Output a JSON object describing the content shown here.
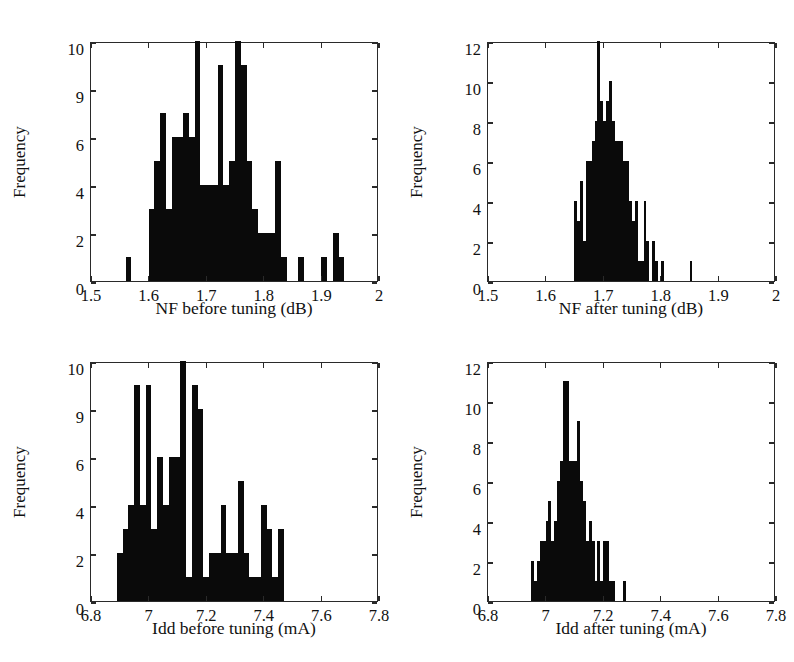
{
  "figure": {
    "kind": "four-panel-histogram-figure",
    "background": "#ffffff",
    "bar_color": "#0a0a0a",
    "axis_color": "#2a2a2a"
  },
  "chart_data": [
    {
      "id": "nf-before-tuning",
      "type": "bar",
      "title": "",
      "xlabel": "NF before tuning (dB)",
      "ylabel": "Frequency",
      "xlim": [
        1.5,
        2.0
      ],
      "ylim": [
        0,
        10
      ],
      "grid": false,
      "legend": "none",
      "xticks": [
        1.5,
        1.6,
        1.7,
        1.8,
        1.9,
        2.0
      ],
      "xticklabels": [
        "1.5",
        "1.6",
        "1.7",
        "1.8",
        "1.9",
        "2"
      ],
      "yticks": [
        0,
        2,
        4,
        6,
        8,
        10
      ],
      "yticklabels": [
        "0",
        "2",
        "4",
        "6",
        "9",
        "10"
      ],
      "bin_width": 0.01,
      "bins": [
        1.56,
        1.57,
        1.58,
        1.59,
        1.6,
        1.61,
        1.62,
        1.63,
        1.64,
        1.65,
        1.66,
        1.67,
        1.68,
        1.69,
        1.7,
        1.71,
        1.72,
        1.73,
        1.74,
        1.75,
        1.76,
        1.77,
        1.78,
        1.79,
        1.8,
        1.81,
        1.82,
        1.83,
        1.84,
        1.86,
        1.87,
        1.9,
        1.92,
        1.93
      ],
      "values": [
        1,
        0,
        0,
        0,
        3,
        5,
        7,
        3,
        6,
        6,
        7,
        6,
        10,
        4,
        4,
        4,
        9,
        4,
        5,
        10,
        9,
        5,
        3,
        2,
        2,
        2,
        5,
        1,
        0,
        1,
        0,
        1,
        2,
        1
      ]
    },
    {
      "id": "nf-after-tuning",
      "type": "bar",
      "title": "",
      "xlabel": "NF after tuning (dB)",
      "ylabel": "Frequency",
      "xlim": [
        1.5,
        2.0
      ],
      "ylim": [
        0,
        12
      ],
      "grid": false,
      "legend": "none",
      "xticks": [
        1.5,
        1.6,
        1.7,
        1.8,
        1.9,
        2.0
      ],
      "xticklabels": [
        "1.5",
        "1.6",
        "1.7",
        "1.8",
        "1.9",
        "2"
      ],
      "yticks": [
        0,
        2,
        4,
        6,
        8,
        10,
        12
      ],
      "yticklabels": [
        "0",
        "2",
        "4",
        "6",
        "8",
        "10",
        "12"
      ],
      "bin_width": 0.005,
      "bins": [
        1.65,
        1.655,
        1.66,
        1.665,
        1.67,
        1.675,
        1.68,
        1.685,
        1.69,
        1.695,
        1.7,
        1.705,
        1.71,
        1.715,
        1.72,
        1.725,
        1.73,
        1.735,
        1.74,
        1.745,
        1.75,
        1.755,
        1.76,
        1.765,
        1.77,
        1.775,
        1.785,
        1.79,
        1.8,
        1.85
      ],
      "values": [
        4,
        3,
        5,
        2,
        6,
        6,
        7,
        8,
        12,
        9,
        8,
        9,
        10,
        8,
        7,
        7,
        7,
        6,
        6,
        4,
        3,
        4,
        1,
        1,
        4,
        2,
        2,
        1,
        1,
        1
      ]
    },
    {
      "id": "idd-before-tuning",
      "type": "bar",
      "title": "",
      "xlabel": "Idd before tuning (mA)",
      "ylabel": "Frequency",
      "xlim": [
        6.8,
        7.8
      ],
      "ylim": [
        0,
        10
      ],
      "grid": false,
      "legend": "none",
      "xticks": [
        6.8,
        7.0,
        7.2,
        7.4,
        7.6,
        7.8
      ],
      "xticklabels": [
        "6.8",
        "7",
        "7.2",
        "7.4",
        "7.6",
        "7.8"
      ],
      "yticks": [
        0,
        2,
        4,
        6,
        8,
        10
      ],
      "yticklabels": [
        "0",
        "2",
        "4",
        "6",
        "9",
        "10"
      ],
      "bin_width": 0.02,
      "bins": [
        6.89,
        6.91,
        6.93,
        6.95,
        6.97,
        6.99,
        7.01,
        7.03,
        7.05,
        7.07,
        7.09,
        7.11,
        7.13,
        7.15,
        7.17,
        7.19,
        7.21,
        7.23,
        7.25,
        7.27,
        7.29,
        7.31,
        7.33,
        7.35,
        7.37,
        7.39,
        7.41,
        7.43,
        7.45
      ],
      "values": [
        2,
        3,
        4,
        9,
        4,
        9,
        3,
        6,
        4,
        6,
        6,
        10,
        1,
        9,
        8,
        1,
        2,
        2,
        4,
        2,
        2,
        5,
        2,
        1,
        1,
        4,
        3,
        1,
        3
      ]
    },
    {
      "id": "idd-after-tuning",
      "type": "bar",
      "title": "",
      "xlabel": "Idd after tuning (mA)",
      "ylabel": "Frequency",
      "xlim": [
        6.8,
        7.8
      ],
      "ylim": [
        0,
        12
      ],
      "grid": false,
      "legend": "none",
      "xticks": [
        6.8,
        7.0,
        7.2,
        7.4,
        7.6,
        7.8
      ],
      "xticklabels": [
        "6.8",
        "7",
        "7.2",
        "7.4",
        "7.6",
        "7.8"
      ],
      "yticks": [
        0,
        2,
        4,
        6,
        8,
        10,
        12
      ],
      "yticklabels": [
        "0",
        "2",
        "4",
        "6",
        "8",
        "10",
        "12"
      ],
      "bin_width": 0.01,
      "bins": [
        6.95,
        6.96,
        6.97,
        6.98,
        6.99,
        7.0,
        7.01,
        7.02,
        7.03,
        7.04,
        7.05,
        7.06,
        7.07,
        7.08,
        7.09,
        7.1,
        7.11,
        7.12,
        7.13,
        7.14,
        7.15,
        7.16,
        7.17,
        7.18,
        7.19,
        7.2,
        7.21,
        7.22,
        7.23,
        7.27
      ],
      "values": [
        2,
        1,
        2,
        3,
        3,
        4,
        5,
        3,
        4,
        6,
        7,
        11,
        11,
        7,
        7,
        7,
        9,
        6,
        5,
        3,
        4,
        3,
        1,
        3,
        1,
        3,
        3,
        1,
        1,
        1
      ]
    }
  ]
}
